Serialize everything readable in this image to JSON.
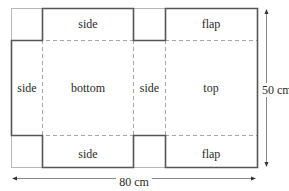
{
  "diagram": {
    "panels": {
      "side_top": "side",
      "side_left": "side",
      "bottom": "bottom",
      "side_middle": "side",
      "top": "top",
      "flap_top": "flap",
      "side_bottom": "side",
      "flap_bottom": "flap"
    },
    "dimensions": {
      "height": "50 cm",
      "width": "80 cm"
    },
    "colors": {
      "outline": "#555555",
      "thin_outline": "#b5b5b5",
      "fold_line": "#aaaaaa",
      "text": "#2a2a2a"
    }
  }
}
